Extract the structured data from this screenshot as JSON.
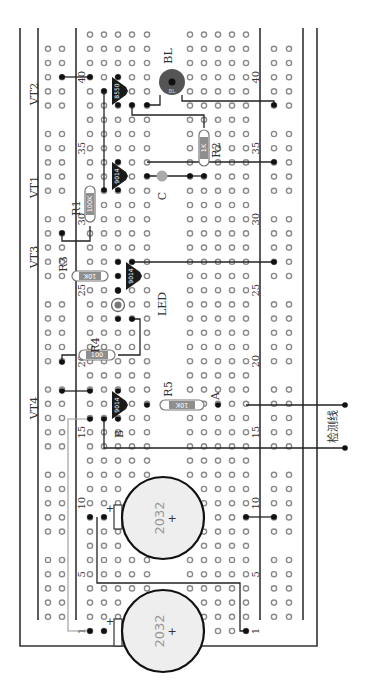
{
  "diagram": {
    "title": "",
    "board": {
      "rows": 43,
      "row_numbers": [
        "1",
        "5",
        "10",
        "15",
        "20",
        "25",
        "30",
        "35",
        "40"
      ],
      "main_columns_left": 5,
      "main_columns_right": 5,
      "power_rails_per_side": 2,
      "rail_group_size": 5
    },
    "components": [
      {
        "id": "VT1",
        "type": "transistor",
        "model": "9014",
        "label": "VT1"
      },
      {
        "id": "VT2",
        "type": "transistor",
        "model": "8550",
        "label": "VT2"
      },
      {
        "id": "VT3",
        "type": "transistor",
        "model": "9014",
        "label": "VT3"
      },
      {
        "id": "VT4",
        "type": "transistor",
        "model": "9014",
        "label": "VT4"
      },
      {
        "id": "R1",
        "type": "resistor",
        "value": "100K",
        "label": "R1"
      },
      {
        "id": "R2",
        "type": "resistor",
        "value": "1K",
        "label": "R2"
      },
      {
        "id": "R3",
        "type": "resistor",
        "value": "10K",
        "label": "R3"
      },
      {
        "id": "R4",
        "type": "resistor",
        "value": "100",
        "label": "R4"
      },
      {
        "id": "R5",
        "type": "resistor",
        "value": "10K",
        "label": "R5"
      },
      {
        "id": "C",
        "type": "capacitor",
        "label": "C"
      },
      {
        "id": "LED",
        "type": "led",
        "label": "LED"
      },
      {
        "id": "BL",
        "type": "buzzer",
        "label": "BL",
        "inner_label": "BL"
      },
      {
        "id": "BAT1",
        "type": "battery",
        "model": "2032",
        "plus": "+"
      },
      {
        "id": "BAT2",
        "type": "battery",
        "model": "2032",
        "plus": "+"
      }
    ],
    "points": {
      "A": "A",
      "B": "B"
    },
    "detection_line_label": "检测线",
    "colors": {
      "hole_stroke": "#8a8a8a",
      "wire": "#222222",
      "wire_grey": "#9a9a9a",
      "buzzer": "#555555",
      "capacitor": "#aaaaaa",
      "led": "#777777",
      "battery_fill": "#eeeeee"
    }
  }
}
